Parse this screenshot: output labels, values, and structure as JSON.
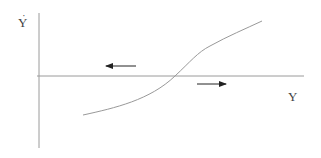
{
  "diagram": {
    "type": "phase-diagram",
    "vertical_axis_label": "Y",
    "vertical_axis_label_dot": "˙",
    "horizontal_axis_label": "Y",
    "colors": {
      "axis": "#9a9a9a",
      "curve": "#999999",
      "arrow": "#222222",
      "label": "#444444"
    },
    "axes": {
      "vertical": {
        "x": 39,
        "y1": 13,
        "y2": 148
      },
      "horizontal": {
        "y": 76,
        "x1": 37,
        "x2": 304
      }
    },
    "curve": {
      "description": "Upward-sloping curve crossing the horizontal axis",
      "points": [
        [
          83,
          115
        ],
        [
          130,
          102
        ],
        [
          175,
          76
        ],
        [
          210,
          48
        ],
        [
          262,
          21
        ]
      ]
    },
    "arrows": [
      {
        "name": "left-arrow",
        "direction": "left",
        "x1": 136,
        "x2": 105,
        "y": 66,
        "position": "above axis, left of crossing"
      },
      {
        "name": "right-arrow",
        "direction": "right",
        "x1": 197,
        "x2": 226,
        "y": 84,
        "position": "below axis, right of crossing"
      }
    ]
  }
}
